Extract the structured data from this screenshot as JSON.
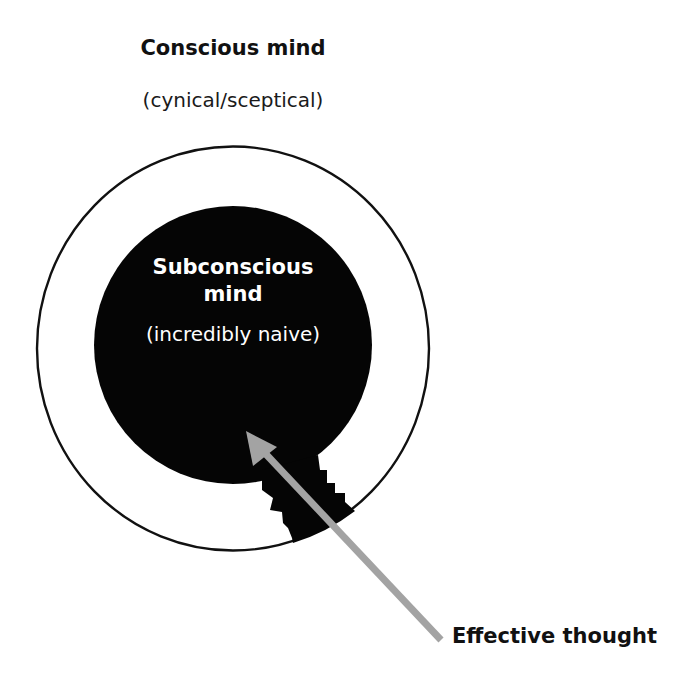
{
  "diagram": {
    "outer_circle": {
      "title": "Conscious mind",
      "subtitle": "(cynical/sceptical)",
      "stroke_color": "#111111",
      "fill_color": "#ffffff"
    },
    "inner_circle": {
      "title": "Subconscious mind",
      "title_line1": "Subconscious",
      "title_line2": "mind",
      "subtitle": "(incredibly naive)",
      "fill_color": "#050505",
      "text_color": "#ffffff"
    },
    "arrow": {
      "label": "Effective thought",
      "color": "#a3a3a3",
      "direction": "from bottom-right outside, piercing the outer circle into the subconscious"
    },
    "breach": {
      "description": "jagged black breach connecting the subconscious to the outer circle where the arrow passes"
    }
  }
}
